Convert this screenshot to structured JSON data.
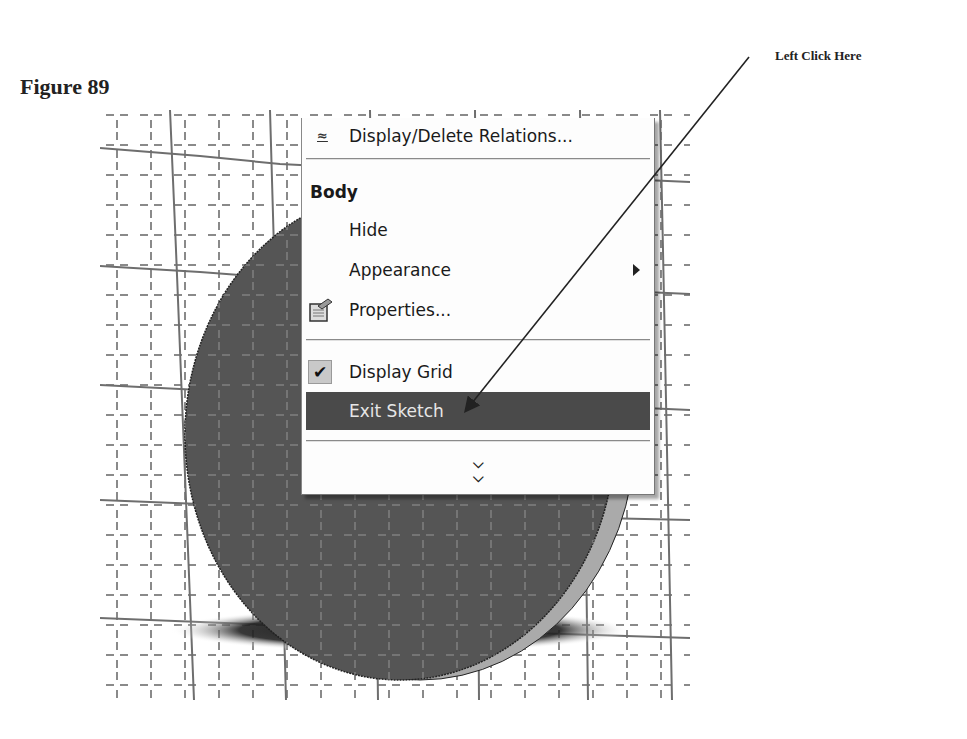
{
  "figure": {
    "title": "Figure 89",
    "callout_text": "Left Click Here"
  },
  "context_menu": {
    "items": [
      {
        "type": "item",
        "label": "Display/Delete Relations...",
        "icon": "relations-icon",
        "partially_cropped": true
      },
      {
        "type": "separator"
      },
      {
        "type": "header",
        "label": "Body"
      },
      {
        "type": "item",
        "label": "Hide"
      },
      {
        "type": "item",
        "label": "Appearance",
        "has_submenu": true,
        "submenu_icon": "triangle-right-icon"
      },
      {
        "type": "item",
        "label": "Properties...",
        "icon": "properties-icon"
      },
      {
        "type": "separator"
      },
      {
        "type": "item",
        "label": "Display Grid",
        "checked": true,
        "icon": "checkmark-icon"
      },
      {
        "type": "item",
        "label": "Exit Sketch",
        "highlighted": true
      },
      {
        "type": "separator"
      },
      {
        "type": "expand",
        "label": "»",
        "icon": "double-chevron-down-icon"
      }
    ]
  },
  "viewport": {
    "background": "#ffffff",
    "grid_color": "#6e6e6e",
    "body_fill": "#555555",
    "body_side_fill": "#aaaaaa",
    "shadow_color": "#1e1e1e"
  },
  "colors": {
    "highlight_bg": "#4a4a4a",
    "highlight_text": "#e6e6e6",
    "menu_bg": "#fdfdfd"
  }
}
